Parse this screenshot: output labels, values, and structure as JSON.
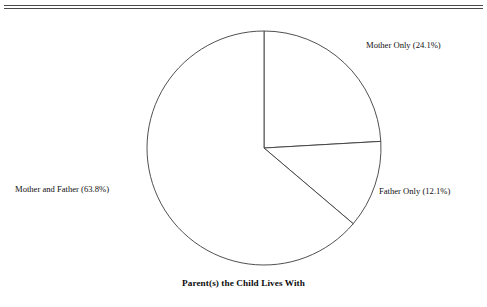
{
  "figure": {
    "clipped_header_text": "",
    "caption": "Parent(s) the Child Lives With"
  },
  "labels": {
    "mother_only": "Mother Only (24.1%)",
    "father_only": "Father Only (12.1%)",
    "mother_and_father": "Mother and Father (63.8%)"
  },
  "colors": {
    "outline": "#3c3c3c",
    "rule": "#4a4a4a",
    "background": "#ffffff",
    "text": "#111111"
  },
  "chart_data": {
    "type": "pie",
    "title": "Parent(s) the Child Lives With",
    "xlabel": "",
    "ylabel": "",
    "categories": [
      "Mother Only",
      "Father Only",
      "Mother and Father"
    ],
    "values": [
      24.1,
      12.1,
      63.8
    ],
    "units": "percent",
    "labels": [
      "Mother Only (24.1%)",
      "Father Only (12.1%)",
      "Mother and Father (63.8%)"
    ],
    "slice_fill": [
      "#ffffff",
      "#ffffff",
      "#ffffff"
    ],
    "slice_stroke": "#3c3c3c",
    "start_angle_deg": 0,
    "direction": "clockwise",
    "legend": "none",
    "grid": false,
    "center_px": [
      264,
      148
    ],
    "radius_px": 117
  }
}
